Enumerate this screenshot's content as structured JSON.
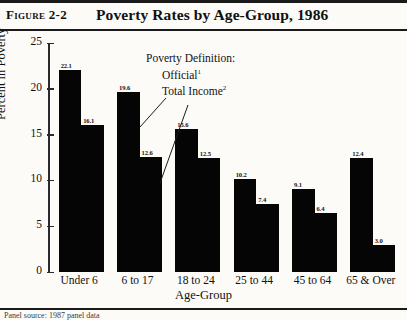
{
  "figure": {
    "number_label": "Figure 2-2",
    "title": "Poverty Rates by Age-Group, 1986"
  },
  "annotation": {
    "heading": "Poverty Definition:",
    "series_one": "Official",
    "series_one_note": "1",
    "series_two": "Total Income",
    "series_two_note": "2"
  },
  "footnote": {
    "text": "Panel source: 1987 panel data"
  },
  "chart_data": {
    "type": "bar",
    "title": "Poverty Rates by Age-Group, 1986",
    "xlabel": "Age-Group",
    "ylabel": "Percent in Poverty",
    "ylim": [
      0,
      25
    ],
    "yticks": [
      0,
      5,
      10,
      15,
      20,
      25
    ],
    "grid": false,
    "legend_position": "inside-top-center",
    "categories": [
      "Under 6",
      "6 to 17",
      "18 to 24",
      "25 to 44",
      "45 to 64",
      "65 & Over"
    ],
    "series": [
      {
        "name": "Official",
        "values": [
          22.1,
          19.6,
          15.6,
          10.2,
          9.1,
          12.4
        ]
      },
      {
        "name": "Total Income",
        "values": [
          16.1,
          12.6,
          12.5,
          7.4,
          6.4,
          3.0
        ]
      }
    ],
    "bar_color": "#050505"
  }
}
